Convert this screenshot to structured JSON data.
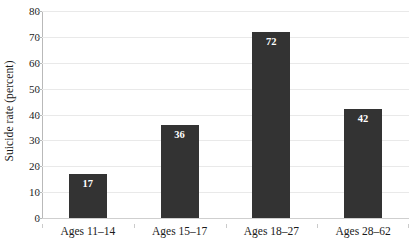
{
  "chart_data": {
    "type": "bar",
    "title": "",
    "subtitle": "",
    "xlabel": "",
    "ylabel": "Suicide rate (percent)",
    "categories": [
      "Ages 11–14",
      "Ages 15–17",
      "Ages 18–27",
      "Ages 28–62"
    ],
    "values": [
      17,
      36,
      72,
      42
    ],
    "data_labels": [
      "17",
      "36",
      "72",
      "42"
    ],
    "ylim": [
      0,
      80
    ],
    "ytick_step": 10,
    "yticks": [
      0,
      10,
      20,
      30,
      40,
      50,
      60,
      70,
      80
    ],
    "ytick_labels": [
      "0",
      "10",
      "20",
      "30",
      "40",
      "50",
      "60",
      "70",
      "80"
    ],
    "grid": "horizontal",
    "legend": "none",
    "legend_position": "none",
    "series": [
      {
        "name": "Suicide rate (percent)",
        "values": [
          17,
          36,
          72,
          42
        ]
      }
    ],
    "colors": {
      "bar": "#333333",
      "gridline": "#e9e9e9",
      "baseline": "#cfcfcf",
      "axis": "#b9b9b9",
      "data_label_text": "#ffffff",
      "tick_text": "#1a1a1a",
      "background": "#ffffff"
    }
  }
}
